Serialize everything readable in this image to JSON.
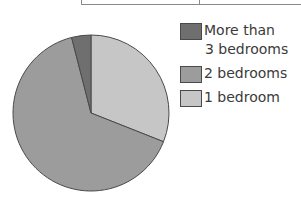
{
  "chart_data": {
    "type": "pie",
    "title": "",
    "categories": [
      "More than 3 bedrooms",
      "2 bedrooms",
      "1 bedroom"
    ],
    "values": [
      4,
      65,
      31
    ],
    "unit": "percent (estimated from slice angles)",
    "colors": [
      "#6f6f6f",
      "#9c9c9c",
      "#c6c6c6"
    ],
    "legend_position": "right",
    "start_angle_deg": 0,
    "direction": "clockwise from 12 o'clock: 1 bedroom, 2 bedrooms, More than 3 bedrooms"
  },
  "legend": {
    "items": [
      {
        "label_line1": "More than",
        "label_line2": "3 bedrooms",
        "color": "#6f6f6f"
      },
      {
        "label_line1": "2 bedrooms",
        "color": "#9c9c9c"
      },
      {
        "label_line1": "1 bedroom",
        "color": "#c6c6c6"
      }
    ]
  }
}
